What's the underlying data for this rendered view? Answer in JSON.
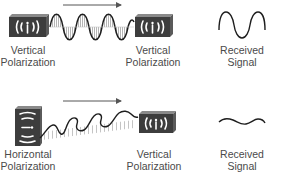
{
  "rows": [
    {
      "name": "matched",
      "transmitter": {
        "icon": "vertical-antenna-icon",
        "label_line1": "Vertical",
        "label_line2": "Polarization"
      },
      "receiver": {
        "icon": "vertical-antenna-icon",
        "label_line1": "Vertical",
        "label_line2": "Polarization"
      },
      "wave": "vertical-wave",
      "direction": "right-arrow",
      "result": {
        "icon": "strong-signal-icon",
        "label_line1": "Received",
        "label_line2": "Signal"
      }
    },
    {
      "name": "mismatched",
      "transmitter": {
        "icon": "horizontal-antenna-icon",
        "label_line1": "Horizontal",
        "label_line2": "Polarization"
      },
      "receiver": {
        "icon": "vertical-antenna-icon",
        "label_line1": "Vertical",
        "label_line2": "Polarization"
      },
      "wave": "horizontal-wave",
      "direction": "right-arrow",
      "result": {
        "icon": "weak-signal-icon",
        "label_line1": "Received",
        "label_line2": "Signal"
      }
    }
  ],
  "colors": {
    "device": "#3d3d3d",
    "device_side": "#6a6a6a",
    "wave": "#1e1e1e",
    "hatch": "#b5b5b5",
    "arrow": "#555555"
  }
}
